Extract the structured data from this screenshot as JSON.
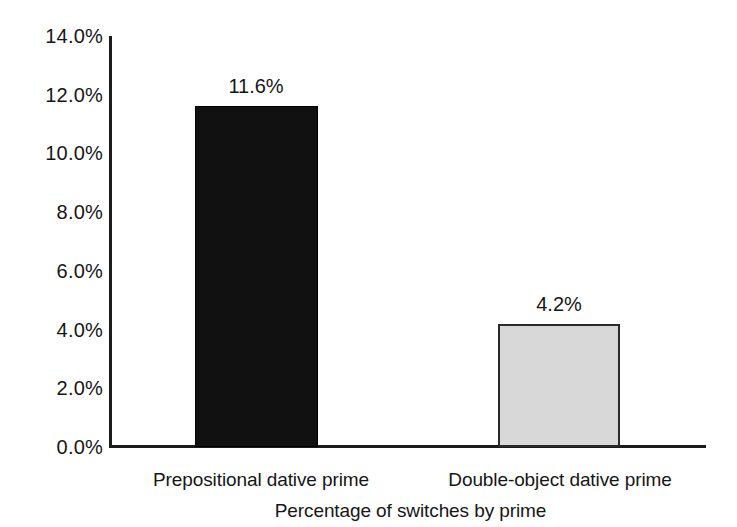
{
  "chart_data": {
    "type": "bar",
    "title": "",
    "xlabel": "Percentage of switches by prime",
    "ylabel": "",
    "categories": [
      "Prepositional dative prime",
      "Double-object dative prime"
    ],
    "values": [
      11.6,
      4.2
    ],
    "value_labels": [
      "11.6%",
      "4.2%"
    ],
    "ylim": [
      0,
      14
    ],
    "ytick_values": [
      14.0,
      12.0,
      10.0,
      8.0,
      6.0,
      4.0,
      2.0,
      0.0
    ],
    "ytick_labels": [
      "14.0%",
      "12.0%",
      "10.0%",
      "8.0%",
      "6.0%",
      "4.0%",
      "2.0%",
      "0.0%"
    ],
    "grid": false,
    "legend": false,
    "legend_position": "none",
    "bar_colors": [
      "#111111",
      "#d8d8d8"
    ],
    "bar_border_colors": [
      "#000000",
      "#2a2a2a"
    ],
    "axis_color": "#1c1c1c",
    "background": "#ffffff"
  },
  "axis": {
    "yticks": [
      {
        "label": "14.0%",
        "value": 14.0
      },
      {
        "label": "12.0%",
        "value": 12.0
      },
      {
        "label": "10.0%",
        "value": 10.0
      },
      {
        "label": "8.0%",
        "value": 8.0
      },
      {
        "label": "6.0%",
        "value": 6.0
      },
      {
        "label": "4.0%",
        "value": 4.0
      },
      {
        "label": "2.0%",
        "value": 2.0
      },
      {
        "label": "0.0%",
        "value": 0.0
      }
    ],
    "x_axis_title": "Percentage of switches by prime"
  },
  "bars": [
    {
      "category": "Prepositional dative prime",
      "value": 11.6,
      "value_label": "11.6%",
      "fill": "#111111"
    },
    {
      "category": "Double-object dative prime",
      "value": 4.2,
      "value_label": "4.2%",
      "fill": "#d8d8d8"
    }
  ]
}
